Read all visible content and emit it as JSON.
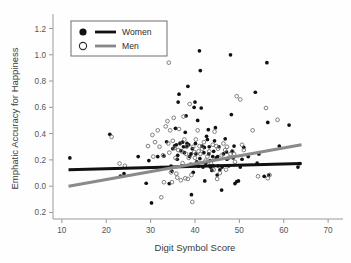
{
  "chart_data": {
    "type": "scatter",
    "title": "",
    "xlabel": "Digit Symbol Score",
    "ylabel": "Emphatic Accuracy for Happiness",
    "xlim": [
      8,
      72
    ],
    "ylim": [
      -0.25,
      1.28
    ],
    "xticks": [
      10,
      20,
      30,
      40,
      50,
      60,
      70
    ],
    "xtick_labels": [
      "10",
      "20",
      "30",
      "40",
      "50",
      "60",
      "70"
    ],
    "yticks": [
      -0.2,
      0.0,
      0.2,
      0.4,
      0.6,
      0.8,
      1.0,
      1.2
    ],
    "ytick_labels": [
      "0.2",
      "0.0",
      "0.2",
      "0.4",
      "0.6",
      "0.8",
      "1.0",
      "1.2"
    ],
    "grid": false,
    "legend_position": "top-left",
    "legend": [
      {
        "name": "Women",
        "marker": "filled-circle",
        "color": "#111111",
        "line_color": "#111111"
      },
      {
        "name": "Men",
        "marker": "open-circle",
        "color": "#ffffff",
        "line_color": "#888888"
      }
    ],
    "series": [
      {
        "name": "Women",
        "marker": "filled-circle",
        "color": "#111111",
        "trendline": {
          "color": "#111111",
          "x": [
            11.5,
            64.0
          ],
          "y": [
            0.125,
            0.172
          ],
          "width": 3.0
        },
        "points": [
          [
            11.8,
            0.215
          ],
          [
            20.8,
            0.395
          ],
          [
            23.2,
            0.077
          ],
          [
            24.0,
            0.095
          ],
          [
            27.2,
            0.225
          ],
          [
            29.0,
            0.022
          ],
          [
            29.6,
            0.195
          ],
          [
            30.2,
            -0.128
          ],
          [
            31.6,
            0.225
          ],
          [
            32.4,
            0.142
          ],
          [
            33.6,
            0.338
          ],
          [
            34.2,
            0.02
          ],
          [
            34.6,
            0.152
          ],
          [
            35.0,
            0.285
          ],
          [
            35.4,
            0.306
          ],
          [
            35.6,
            0.44
          ],
          [
            35.8,
            0.315
          ],
          [
            36.0,
            0.205
          ],
          [
            36.2,
            0.64
          ],
          [
            36.4,
            0.7
          ],
          [
            36.6,
            0.325
          ],
          [
            36.8,
            0.27
          ],
          [
            37.0,
            0.155
          ],
          [
            37.2,
            0.335
          ],
          [
            37.4,
            0.3
          ],
          [
            37.6,
            0.255
          ],
          [
            37.8,
            0.41
          ],
          [
            38.0,
            0.535
          ],
          [
            38.2,
            0.325
          ],
          [
            38.4,
            0.76
          ],
          [
            38.6,
            0.315
          ],
          [
            38.8,
            0.225
          ],
          [
            39.0,
            0.165
          ],
          [
            39.2,
            -0.065
          ],
          [
            39.4,
            0.285
          ],
          [
            39.6,
            0.105
          ],
          [
            39.8,
            0.6
          ],
          [
            40.0,
            0.64
          ],
          [
            40.2,
            0.245
          ],
          [
            40.4,
            0.185
          ],
          [
            40.6,
            0.5
          ],
          [
            40.8,
            0.152
          ],
          [
            41.0,
            1.03
          ],
          [
            41.2,
            0.88
          ],
          [
            41.4,
            0.595
          ],
          [
            41.6,
            0.305
          ],
          [
            41.8,
            0.145
          ],
          [
            42.0,
            0.255
          ],
          [
            42.2,
            0.04
          ],
          [
            42.4,
            0.175
          ],
          [
            42.6,
            0.38
          ],
          [
            42.8,
            0.355
          ],
          [
            43.0,
            0.43
          ],
          [
            43.2,
            0.3
          ],
          [
            43.4,
            0.195
          ],
          [
            43.6,
            0.155
          ],
          [
            43.8,
            0.12
          ],
          [
            44.0,
            0.225
          ],
          [
            44.2,
            0.265
          ],
          [
            44.4,
            0.345
          ],
          [
            44.6,
            0.445
          ],
          [
            44.8,
            0.215
          ],
          [
            45.0,
            0.085
          ],
          [
            45.2,
            0.155
          ],
          [
            45.4,
            0.3
          ],
          [
            45.6,
            0.125
          ],
          [
            46.0,
            -0.03
          ],
          [
            46.4,
            0.245
          ],
          [
            46.8,
            0.36
          ],
          [
            47.2,
            0.205
          ],
          [
            47.6,
            0.155
          ],
          [
            48.0,
            1.0
          ],
          [
            48.2,
            0.545
          ],
          [
            48.4,
            0.265
          ],
          [
            48.6,
            0.215
          ],
          [
            48.8,
            0.305
          ],
          [
            49.0,
            0.02
          ],
          [
            49.4,
            0.035
          ],
          [
            49.8,
            0.04
          ],
          [
            50.2,
            0.145
          ],
          [
            50.6,
            0.205
          ],
          [
            51.0,
            0.295
          ],
          [
            52.0,
            0.225
          ],
          [
            53.6,
            0.715
          ],
          [
            54.0,
            0.175
          ],
          [
            54.4,
            0.245
          ],
          [
            55.6,
            0.075
          ],
          [
            56.2,
            0.94
          ],
          [
            56.4,
            0.485
          ],
          [
            56.6,
            0.085
          ],
          [
            59.0,
            0.305
          ],
          [
            61.2,
            0.465
          ],
          [
            63.2,
            0.145
          ],
          [
            63.6,
            0.172
          ],
          [
            33.0,
            0.23
          ],
          [
            34.8,
            0.115
          ],
          [
            36.1,
            0.235
          ],
          [
            38.1,
            0.3
          ],
          [
            39.1,
            0.245
          ],
          [
            40.1,
            0.325
          ],
          [
            41.1,
            0.21
          ],
          [
            42.1,
            0.295
          ],
          [
            43.1,
            0.245
          ],
          [
            44.1,
            0.155
          ],
          [
            45.1,
            0.225
          ],
          [
            46.1,
            0.145
          ],
          [
            47.1,
            0.26
          ],
          [
            43.3,
            0.155
          ],
          [
            43.5,
            0.145
          ]
        ]
      },
      {
        "name": "Men",
        "marker": "open-circle",
        "color": "#6b6b6b",
        "trendline": {
          "color": "#8a8a8a",
          "x": [
            11.5,
            64.0
          ],
          "y": [
            0.0,
            0.315
          ],
          "width": 3.0
        },
        "points": [
          [
            21.2,
            0.375
          ],
          [
            23.0,
            0.172
          ],
          [
            24.2,
            0.155
          ],
          [
            29.4,
            0.305
          ],
          [
            30.6,
            0.225
          ],
          [
            31.0,
            0.335
          ],
          [
            31.6,
            0.425
          ],
          [
            32.0,
            0.3
          ],
          [
            32.4,
            -0.085
          ],
          [
            32.8,
            0.235
          ],
          [
            33.0,
            0.03
          ],
          [
            33.4,
            0.455
          ],
          [
            33.8,
            0.495
          ],
          [
            34.0,
            0.325
          ],
          [
            34.2,
            0.255
          ],
          [
            34.4,
            0.425
          ],
          [
            34.6,
            0.105
          ],
          [
            34.8,
            0.03
          ],
          [
            35.0,
            0.345
          ],
          [
            35.2,
            0.52
          ],
          [
            35.4,
            0.29
          ],
          [
            35.6,
            0.215
          ],
          [
            35.8,
            0.095
          ],
          [
            36.0,
            0.065
          ],
          [
            36.2,
            0.275
          ],
          [
            36.4,
            0.435
          ],
          [
            36.6,
            0.325
          ],
          [
            36.8,
            0.045
          ],
          [
            37.0,
            0.265
          ],
          [
            37.2,
            0.175
          ],
          [
            37.4,
            0.53
          ],
          [
            37.6,
            0.355
          ],
          [
            37.8,
            0.06
          ],
          [
            38.0,
            0.245
          ],
          [
            38.2,
            0.305
          ],
          [
            38.4,
            0.055
          ],
          [
            38.6,
            0.215
          ],
          [
            38.8,
            0.625
          ],
          [
            39.0,
            0.165
          ],
          [
            39.2,
            0.085
          ],
          [
            39.4,
            -0.12
          ],
          [
            39.6,
            0.3
          ],
          [
            39.8,
            0.26
          ],
          [
            40.0,
            0.215
          ],
          [
            40.2,
            0.355
          ],
          [
            40.4,
            0.175
          ],
          [
            40.6,
            0.425
          ],
          [
            40.8,
            0.265
          ],
          [
            41.0,
            0.305
          ],
          [
            41.2,
            0.245
          ],
          [
            41.6,
            0.285
          ],
          [
            42.0,
            0.335
          ],
          [
            42.4,
            0.195
          ],
          [
            42.8,
            0.225
          ],
          [
            43.2,
            0.265
          ],
          [
            43.6,
            0.175
          ],
          [
            44.0,
            0.315
          ],
          [
            44.4,
            0.415
          ],
          [
            44.8,
            0.305
          ],
          [
            45.2,
            0.285
          ],
          [
            45.6,
            0.1
          ],
          [
            46.0,
            0.235
          ],
          [
            46.4,
            0.325
          ],
          [
            46.8,
            0.275
          ],
          [
            47.2,
            0.3
          ],
          [
            47.6,
            0.215
          ],
          [
            48.0,
            0.245
          ],
          [
            48.4,
            0.265
          ],
          [
            48.8,
            0.245
          ],
          [
            49.4,
            0.685
          ],
          [
            50.2,
            0.66
          ],
          [
            50.6,
            0.315
          ],
          [
            51.0,
            0.275
          ],
          [
            53.0,
            0.425
          ],
          [
            54.2,
            0.075
          ],
          [
            56.0,
            0.595
          ],
          [
            56.4,
            0.06
          ],
          [
            56.8,
            0.085
          ],
          [
            58.6,
            0.505
          ],
          [
            30.4,
            0.39
          ],
          [
            34.1,
            0.94
          ],
          [
            44.2,
            0.125
          ],
          [
            45.0,
            0.055
          ],
          [
            47.0,
            0.125
          ],
          [
            49.0,
            0.185
          ]
        ]
      }
    ]
  }
}
